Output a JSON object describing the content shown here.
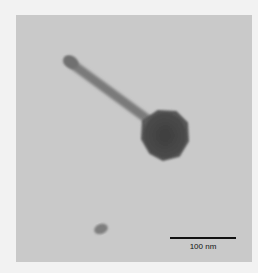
{
  "figure": {
    "type": "transmission electron micrograph",
    "scale_bar": {
      "label": "100 nm"
    }
  }
}
